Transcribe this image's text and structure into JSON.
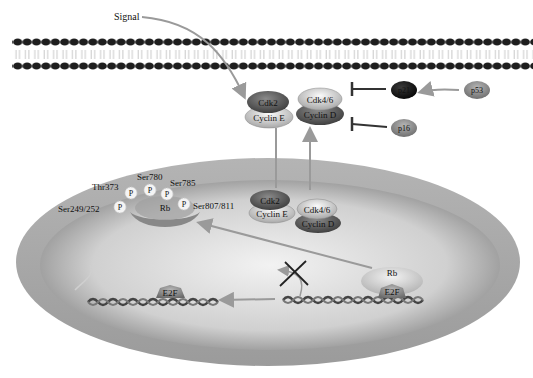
{
  "labels": {
    "signal": "Signal",
    "cdk2": "Cdk2",
    "cyclin_e": "Cyclin E",
    "cdk46": "Cdk4/6",
    "cyclin_d": "Cyclin D",
    "p21": "p21",
    "p53": "p53",
    "p16": "p16",
    "rb": "Rb",
    "e2f": "E2F",
    "phospho": "P"
  },
  "phosphosites": [
    "Ser249/252",
    "Thr373",
    "Ser780",
    "Ser785",
    "Ser807/811"
  ],
  "colors": {
    "arrow": "#9a9a9a",
    "inhibitor": "#333333",
    "membrane_head": "#1e1e1e",
    "nucleus_outer": "#a8a8a8",
    "nucleus_inner": "#d6d6d6"
  }
}
